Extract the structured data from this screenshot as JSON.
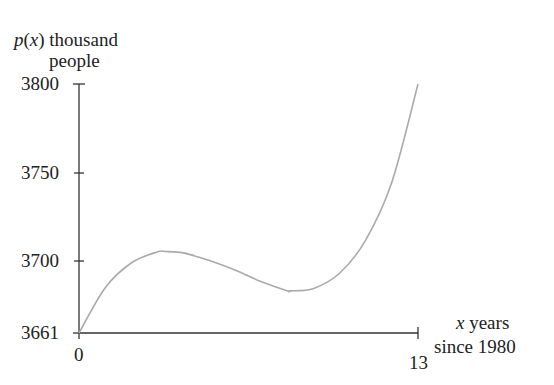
{
  "chart_data": {
    "type": "line",
    "title": "",
    "ylabel_parts": {
      "func": "p",
      "var": "x",
      "rest": " thousand",
      "line2": "people"
    },
    "xlabel_parts": {
      "var": "x",
      "rest": " years",
      "line2": "since 1980"
    },
    "xlabel": "x years since 1980",
    "ylabel": "p(x) thousand people",
    "xlim": [
      0,
      13
    ],
    "ylim": [
      3661,
      3800
    ],
    "x_ticks": [
      0,
      13
    ],
    "y_ticks": [
      3661,
      3700,
      3750,
      3800
    ],
    "x_tick_labels": [
      "0",
      "13"
    ],
    "y_tick_labels": [
      "3661",
      "3700",
      "3750",
      "3800"
    ],
    "grid": false,
    "legend": null,
    "series": [
      {
        "name": "p(x)",
        "color": "#aaaaaa",
        "x": [
          0,
          1,
          2,
          3,
          3.3,
          4,
          5,
          6,
          7,
          8,
          8.1,
          9,
          10,
          11,
          12,
          13
        ],
        "values": [
          3661,
          3686.2,
          3700.1,
          3706.3,
          3706.5,
          3705.7,
          3701.4,
          3696.0,
          3689.6,
          3684.5,
          3684.5,
          3685.9,
          3694.5,
          3713.0,
          3745.3,
          3800
        ]
      }
    ],
    "annotations": []
  },
  "colors": {
    "axis": "#333333",
    "curve": "#aaaaaa",
    "text": "#222222"
  }
}
